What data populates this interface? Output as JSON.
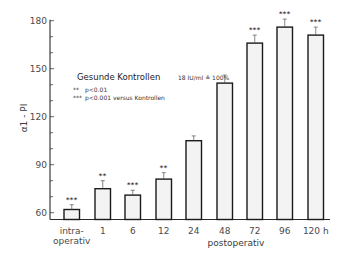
{
  "chart_data": {
    "type": "bar",
    "title": "",
    "xlabel": "postoperativ",
    "ylabel": "α1 - PI",
    "ylim": [
      55,
      180
    ],
    "yticks": [
      60,
      90,
      120,
      150,
      180
    ],
    "grid": false,
    "categories": [
      "intra-operativ",
      "1",
      "6",
      "12",
      "24",
      "48",
      "72",
      "96",
      "120 h"
    ],
    "category_lines": [
      [
        "intra-",
        "operativ"
      ],
      [
        "1"
      ],
      [
        "6"
      ],
      [
        "12"
      ],
      [
        "24"
      ],
      [
        "48"
      ],
      [
        "72"
      ],
      [
        "96"
      ],
      [
        "120 h"
      ]
    ],
    "values": [
      62,
      75,
      71,
      81,
      105,
      141,
      166,
      176,
      171
    ],
    "errors": [
      3,
      5,
      3,
      4,
      3,
      5,
      5,
      5,
      5
    ],
    "significance": [
      "***",
      "**",
      "***",
      "**",
      "",
      "",
      "***",
      "***",
      "***"
    ],
    "legend": {
      "title": "Gesunde Kontrollen",
      "reference": "18 IU/ml ≙ 100%",
      "notes": [
        {
          "marker": "**",
          "text": "p<0.01"
        },
        {
          "marker": "***",
          "text": "p<0.001 versus Kontrollen"
        }
      ]
    },
    "colors": {
      "bar_fill": "#f3f3f3",
      "bar_stroke": "#1a1a1a",
      "axis": "#2a2a2a"
    }
  }
}
